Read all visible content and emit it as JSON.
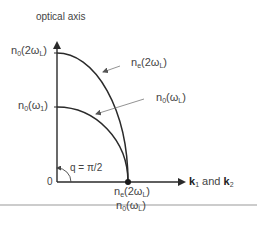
{
  "diagram": {
    "title": "optical axis",
    "origin_label": "0",
    "angle_label": "q = π/2",
    "horizontal_axis": {
      "label_k1": "k",
      "label_k1_sub": "1",
      "label_and": " and ",
      "label_k2": "k",
      "label_k2_sub": "2"
    },
    "y_labels": {
      "top": {
        "main": "n",
        "sub": "0",
        "arg": "(2ω",
        "arg_sub": "L",
        "close": ")"
      },
      "middle": {
        "main": "n",
        "sub": "0",
        "arg": "(ω",
        "arg_sub": "1",
        "close": ")"
      }
    },
    "curve_labels": {
      "outer": {
        "main": "n",
        "sub": "e",
        "arg": "(2ω",
        "arg_sub": "L",
        "close": ")"
      },
      "inner": {
        "main": "n",
        "sub": "0",
        "arg": "(ω",
        "arg_sub": "L",
        "close": ")"
      }
    },
    "x_labels": {
      "upper": {
        "main": "n",
        "sub": "e",
        "arg": "(2ω",
        "arg_sub": "L",
        "close": ")"
      },
      "lower": {
        "main": "n",
        "sub": "0",
        "arg": "(ω",
        "arg_sub": "L",
        "close": ")"
      }
    },
    "colors": {
      "axis": "#2a2a2a",
      "curve": "#2a2a2a",
      "pointer": "#777777",
      "separator": "#999999"
    }
  }
}
